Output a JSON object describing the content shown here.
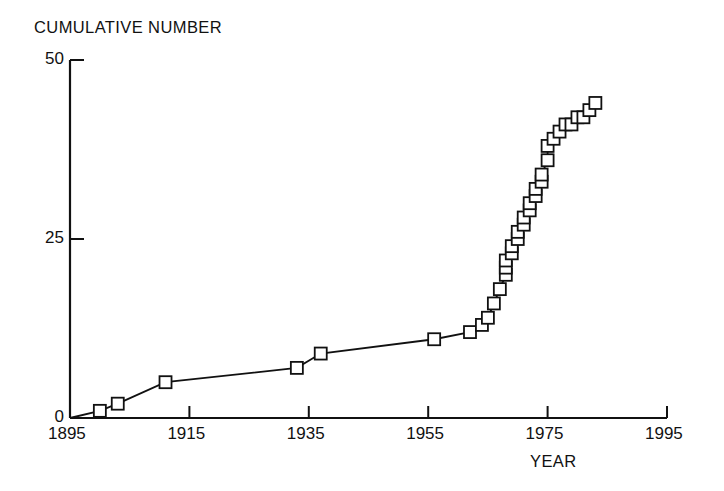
{
  "chart_data": {
    "type": "line",
    "title": "",
    "ylabel": "CUMULATIVE NUMBER",
    "xlabel": "YEAR",
    "xlim": [
      1895,
      1995
    ],
    "ylim": [
      0,
      50
    ],
    "xticks": [
      1895,
      1915,
      1935,
      1955,
      1975,
      1995
    ],
    "xtick_labels": [
      "1895",
      "1915",
      "1935",
      "1955",
      "1975",
      "1995"
    ],
    "yticks": [
      0,
      25,
      50
    ],
    "ytick_labels": [
      "0",
      "25",
      "50"
    ],
    "grid": false,
    "legend": null,
    "marker": "open-square",
    "series": [
      {
        "name": "cumulative count",
        "x": [
          1895,
          1900,
          1903,
          1911,
          1933,
          1937,
          1956,
          1962,
          1964,
          1965,
          1966,
          1967,
          1968,
          1968,
          1968,
          1969,
          1969,
          1970,
          1970,
          1971,
          1971,
          1972,
          1972,
          1973,
          1973,
          1974,
          1974,
          1975,
          1975,
          1976,
          1977,
          1978,
          1979,
          1980,
          1981,
          1982,
          1983
        ],
        "y": [
          0,
          1,
          2,
          5,
          7,
          9,
          11,
          12,
          13,
          14,
          16,
          18,
          20,
          21,
          22,
          23,
          24,
          25,
          26,
          27,
          28,
          29,
          30,
          31,
          32,
          33,
          34,
          36,
          38,
          39,
          40,
          41,
          41,
          42,
          42,
          43,
          44
        ]
      }
    ]
  },
  "axes": {
    "ylabel_text": "CUMULATIVE NUMBER",
    "xlabel_text": "YEAR"
  }
}
